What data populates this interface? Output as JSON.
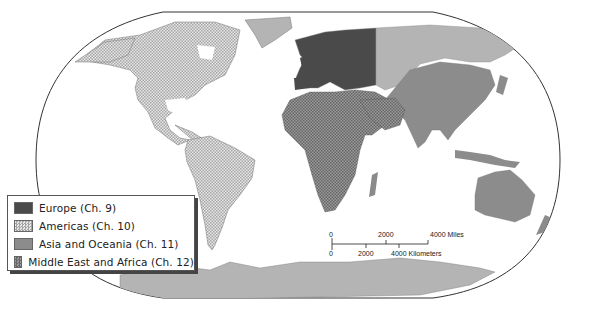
{
  "map": {
    "projection": "Robinson-style world map",
    "colors": {
      "europe": "#4a4a4a",
      "americas_base": "#e6e6e6",
      "americas_hatch": "#9a9a9a",
      "asia_oceania": "#8c8c8c",
      "mea_base": "#8a8a8a",
      "mea_hatch": "#5a5a5a",
      "russia_greenland_antarctica": "#b4b4b4",
      "outline": "#333333",
      "ocean": "#ffffff"
    }
  },
  "legend": {
    "items": [
      {
        "label": "Europe (Ch. 9)",
        "pattern": "europe"
      },
      {
        "label": "Americas (Ch. 10)",
        "pattern": "americas"
      },
      {
        "label": "Asia and Oceania (Ch. 11)",
        "pattern": "asia"
      },
      {
        "label": "Middle East and Africa (Ch. 12)",
        "pattern": "mea"
      }
    ]
  },
  "scale_bar": {
    "miles": {
      "ticks": [
        "0",
        "2000",
        "4000 Miles"
      ]
    },
    "kilometers": {
      "ticks": [
        "0",
        "2000",
        "4000 Kilometers"
      ]
    }
  }
}
